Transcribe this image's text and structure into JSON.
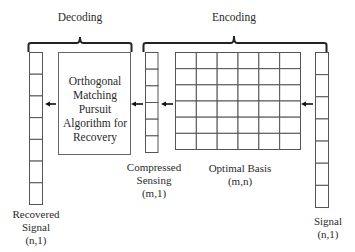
{
  "sections": {
    "decoding": {
      "label": "Decoding"
    },
    "encoding": {
      "label": "Encoding"
    }
  },
  "recovered_signal": {
    "label_line1": "Recovered",
    "label_line2": "Signal",
    "dims": "(n,1)",
    "cells": 7
  },
  "recovery_algorithm": {
    "line1": "Orthogonal",
    "line2": "Matching Pursuit",
    "line3": "Algorithm for",
    "line4": "Recovery"
  },
  "compressed_sensing": {
    "label_line1": "Compressed",
    "label_line2": "Sensing",
    "dims": "(m,1)",
    "cells": 6
  },
  "optimal_basis": {
    "label": "Optimal Basis",
    "dims": "(m,n)",
    "rows": 6,
    "cols": 6
  },
  "signal": {
    "label": "Signal",
    "dims": "(n,1)",
    "cells": 7
  },
  "colors": {
    "stroke": "#333333",
    "grid": "#555555",
    "background": "#ffffff"
  }
}
